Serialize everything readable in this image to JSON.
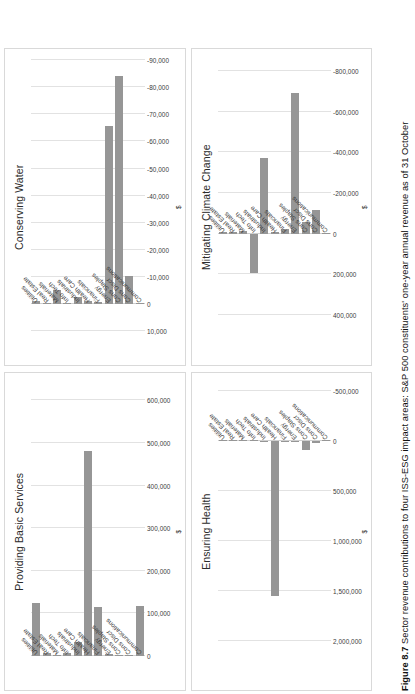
{
  "figure": {
    "number_label": "Figure 8.7",
    "caption": "Sector revenue contributions to four ISS-ESG impact areas: S&P 500 constituents' one-year annual revenue as of 31 October"
  },
  "categories": [
    "Communications",
    "Cons Discr",
    "Cons Staples",
    "Energy",
    "Financials",
    "Health Care",
    "Industrials",
    "Info Tech",
    "Materials",
    "Real Estate",
    "Utilities"
  ],
  "axis_label": "$",
  "bar_color": "#969696",
  "gridline_color": "#e2e2e2",
  "panels": [
    {
      "key": "providing_basic_services",
      "title": "Providing Basic Services"
    },
    {
      "key": "conserving_water",
      "title": "Conserving Water"
    },
    {
      "key": "ensuring_health",
      "title": "Ensuring Health"
    },
    {
      "key": "mitigating_climate_change",
      "title": "Mitigating Climate Change"
    }
  ],
  "chart_data": [
    {
      "type": "bar",
      "orientation": "horizontal",
      "title": "Providing Basic Services",
      "xlabel": "$",
      "ylabel": "",
      "grid": true,
      "legend": "none",
      "xlim": [
        0,
        650000
      ],
      "ticks": [
        0,
        100000,
        200000,
        300000,
        400000,
        500000,
        600000
      ],
      "tick_labels": [
        "0",
        "100,000",
        "200,000",
        "300,000",
        "400,000",
        "500,000",
        "600,000"
      ],
      "categories": [
        "Communications",
        "Cons Discr",
        "Cons Staples",
        "Energy",
        "Financials",
        "Health Care",
        "Industrials",
        "Info Tech",
        "Materials",
        "Real Estate",
        "Utilities"
      ],
      "values": [
        118000,
        2000,
        1000,
        5000,
        116000,
        482000,
        32000,
        6000,
        1000,
        8000,
        124000
      ]
    },
    {
      "type": "bar",
      "orientation": "horizontal",
      "title": "Conserving Water",
      "xlabel": "$",
      "ylabel": "",
      "grid": true,
      "legend": "none",
      "xlim": [
        10000,
        -92000
      ],
      "ticks": [
        10000,
        0,
        -10000,
        -20000,
        -30000,
        -40000,
        -50000,
        -60000,
        -70000,
        -80000,
        -90000
      ],
      "tick_labels": [
        "10,000",
        "0",
        "-10,000",
        "-20,000",
        "-30,000",
        "-40,000",
        "-50,000",
        "-60,000",
        "-70,000",
        "-80,000",
        "-90,000"
      ],
      "categories": [
        "Communications",
        "Cons Discr",
        "Cons Staples",
        "Energy",
        "Financials",
        "Health Care",
        "Industrials",
        "Info Tech",
        "Materials",
        "Real Estate",
        "Utilities"
      ],
      "values": [
        -200,
        -10500,
        -84000,
        -65500,
        -900,
        -1200,
        -2600,
        -300,
        -5200,
        -200,
        -1400
      ]
    },
    {
      "type": "bar",
      "orientation": "horizontal",
      "title": "Ensuring Health",
      "xlabel": "$",
      "ylabel": "",
      "grid": true,
      "legend": "none",
      "xlim": [
        2150000,
        -620000
      ],
      "ticks": [
        2000000,
        1500000,
        1000000,
        500000,
        0,
        -500000
      ],
      "tick_labels": [
        "2,000,000",
        "1,500,000",
        "1,000,000",
        "500,000",
        "0",
        "-500,000"
      ],
      "categories": [
        "Communications",
        "Cons Discr",
        "Cons Staples",
        "Energy",
        "Financials",
        "Health Care",
        "Industrials",
        "Info Tech",
        "Materials",
        "Real Estate",
        "Utilities"
      ],
      "values": [
        3000,
        23000,
        92000,
        8000,
        12000,
        1552000,
        14000,
        3000,
        2000,
        1000,
        1000
      ]
    },
    {
      "type": "bar",
      "orientation": "horizontal",
      "title": "Mitigating Climate Change",
      "xlabel": "$",
      "ylabel": "",
      "grid": true,
      "legend": "none",
      "xlim": [
        480000,
        -880000
      ],
      "ticks": [
        400000,
        200000,
        0,
        -200000,
        -400000,
        -600000,
        -800000
      ],
      "tick_labels": [
        "400,000",
        "200,000",
        "0",
        "-200,000",
        "-400,000",
        "-600,000",
        "-800,000"
      ],
      "categories": [
        "Communications",
        "Cons Discr",
        "Cons Staples",
        "Energy",
        "Financials",
        "Health Care",
        "Industrials",
        "Info Tech",
        "Materials",
        "Real Estate",
        "Utilities"
      ],
      "values": [
        -6000,
        -118000,
        -57000,
        -690000,
        -21000,
        -9000,
        -370000,
        192000,
        -12000,
        -8000,
        -10000
      ]
    }
  ]
}
